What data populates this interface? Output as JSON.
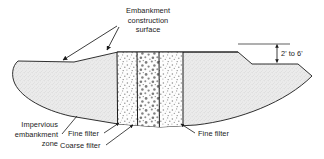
{
  "figure": {
    "background_color": "#ffffff",
    "line_color": "#1a1a1a",
    "fill_color": "#e8e8e8"
  },
  "labels": {
    "embankment_surface": {
      "line1": "Embankment",
      "line2": "construction",
      "line3": "surface"
    },
    "impervious_zone": {
      "line1": "Impervious",
      "line2": "embankment",
      "line3": "zone"
    },
    "fine_filter_left": "Fine filter",
    "coarse_filter": "Coarse filter",
    "fine_filter_right": "Fine filter",
    "lift_thickness": "2' to 6'"
  },
  "zones": [
    {
      "name": "impervious-embankment-zone-left",
      "pattern": "stipple-fine-gray"
    },
    {
      "name": "fine-filter-left",
      "pattern": "speckle-fine"
    },
    {
      "name": "coarse-filter",
      "pattern": "speckle-coarse"
    },
    {
      "name": "fine-filter-right",
      "pattern": "speckle-fine"
    },
    {
      "name": "impervious-embankment-zone-right",
      "pattern": "stipple-fine-gray"
    }
  ]
}
